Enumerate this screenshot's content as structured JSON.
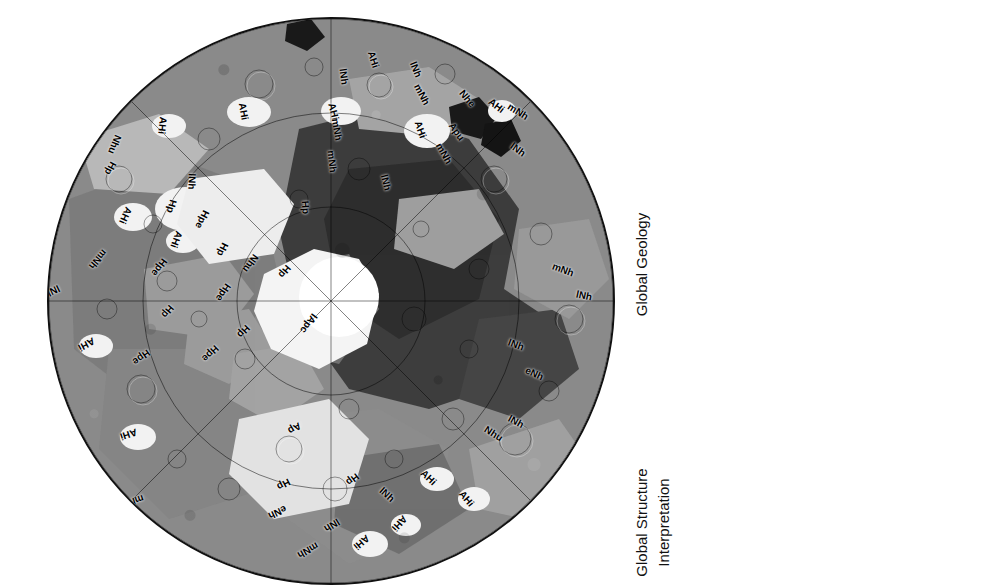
{
  "figure": {
    "kind": "geologic-map",
    "projection": "polar-stereographic"
  },
  "map": {
    "background_color": "#8a8a8a",
    "border_color": "#111111",
    "labels": [
      {
        "text": "AHi",
        "x": 377,
        "y": 58,
        "rot": -18
      },
      {
        "text": "lNh",
        "x": 348,
        "y": 75,
        "rot": -8
      },
      {
        "text": "lNh",
        "x": 420,
        "y": 68,
        "rot": -22
      },
      {
        "text": "mNh",
        "x": 423,
        "y": 93,
        "rot": -28
      },
      {
        "text": "Nhe",
        "x": 470,
        "y": 97,
        "rot": -40
      },
      {
        "text": "AHi",
        "x": 500,
        "y": 104,
        "rot": -52
      },
      {
        "text": "mNh",
        "x": 519,
        "y": 110,
        "rot": -58
      },
      {
        "text": "AHi",
        "x": 247,
        "y": 110,
        "rot": -10
      },
      {
        "text": "AHi",
        "x": 337,
        "y": 110,
        "rot": -14
      },
      {
        "text": "mNh",
        "x": 338,
        "y": 128,
        "rot": -10
      },
      {
        "text": "AHi",
        "x": 424,
        "y": 128,
        "rot": -20
      },
      {
        "text": "Apu",
        "x": 459,
        "y": 130,
        "rot": -36
      },
      {
        "text": "AHi",
        "x": 166,
        "y": 124,
        "rot": 6
      },
      {
        "text": "mNh",
        "x": 333,
        "y": 160,
        "rot": -6
      },
      {
        "text": "mNh",
        "x": 445,
        "y": 152,
        "rot": -30
      },
      {
        "text": "lNh",
        "x": 522,
        "y": 148,
        "rot": -54
      },
      {
        "text": "Nhu",
        "x": 117,
        "y": 143,
        "rot": 22
      },
      {
        "text": "Hp",
        "x": 116,
        "y": 167,
        "rot": 28
      },
      {
        "text": "lNh",
        "x": 196,
        "y": 180,
        "rot": 2
      },
      {
        "text": "lNh",
        "x": 390,
        "y": 181,
        "rot": -14
      },
      {
        "text": "Hp",
        "x": 311,
        "y": 206,
        "rot": -4
      },
      {
        "text": "AHi",
        "x": 129,
        "y": 214,
        "rot": 24
      },
      {
        "text": "Hp",
        "x": 177,
        "y": 205,
        "rot": 16
      },
      {
        "text": "AHi",
        "x": 180,
        "y": 238,
        "rot": 20
      },
      {
        "text": "AHi",
        "x": 55,
        "y": 206,
        "rot": 50
      },
      {
        "text": "mNh",
        "x": 99,
        "y": 258,
        "rot": 40
      },
      {
        "text": "Hpe",
        "x": 205,
        "y": 218,
        "rot": 26
      },
      {
        "text": "Hpe",
        "x": 162,
        "y": 266,
        "rot": 36
      },
      {
        "text": "Hp",
        "x": 228,
        "y": 248,
        "rot": 26
      },
      {
        "text": "Nhu",
        "x": 253,
        "y": 262,
        "rot": 36
      },
      {
        "text": "Hpe",
        "x": 226,
        "y": 291,
        "rot": 34
      },
      {
        "text": "Hp",
        "x": 173,
        "y": 310,
        "rot": 40
      },
      {
        "text": "lNh",
        "x": 56,
        "y": 290,
        "rot": 64
      },
      {
        "text": "mNh",
        "x": 564,
        "y": 268,
        "rot": -70
      },
      {
        "text": "lNh",
        "x": 588,
        "y": 294,
        "rot": -78
      },
      {
        "text": "lApc",
        "x": 310,
        "y": 322,
        "rot": 36
      },
      {
        "text": "Hpe",
        "x": 213,
        "y": 352,
        "rot": 46
      },
      {
        "text": "AHi",
        "x": 90,
        "y": 343,
        "rot": 62
      },
      {
        "text": "Hpe",
        "x": 144,
        "y": 356,
        "rot": 54
      },
      {
        "text": "Hp",
        "x": 249,
        "y": 330,
        "rot": 44
      },
      {
        "text": "lNh",
        "x": 520,
        "y": 343,
        "rot": -70
      },
      {
        "text": "eNh",
        "x": 537,
        "y": 372,
        "rot": -66
      },
      {
        "text": "AHi",
        "x": 132,
        "y": 433,
        "rot": 72
      },
      {
        "text": "Ap",
        "x": 300,
        "y": 427,
        "rot": 58
      },
      {
        "text": "lNh",
        "x": 520,
        "y": 420,
        "rot": -62
      },
      {
        "text": "Nhu",
        "x": 496,
        "y": 432,
        "rot": -58
      },
      {
        "text": "Hp",
        "x": 290,
        "y": 270,
        "rot": 40
      },
      {
        "text": "Hp",
        "x": 358,
        "y": 478,
        "rot": 52
      },
      {
        "text": "Hp",
        "x": 289,
        "y": 483,
        "rot": 62
      },
      {
        "text": "eNh",
        "x": 280,
        "y": 511,
        "rot": 64
      },
      {
        "text": "lNh",
        "x": 391,
        "y": 493,
        "rot": -48
      },
      {
        "text": "AHi",
        "x": 432,
        "y": 476,
        "rot": -46
      },
      {
        "text": "lNh",
        "x": 336,
        "y": 524,
        "rot": 58
      },
      {
        "text": "mNh",
        "x": 309,
        "y": 549,
        "rot": 60
      },
      {
        "text": "AHi",
        "x": 365,
        "y": 541,
        "rot": 50
      },
      {
        "text": "AHi",
        "x": 403,
        "y": 522,
        "rot": 42
      },
      {
        "text": "AHi",
        "x": 470,
        "y": 497,
        "rot": -40
      },
      {
        "text": "mNh",
        "x": 134,
        "y": 500,
        "rot": 72
      }
    ]
  },
  "legend": {
    "structure": {
      "header": "Global  Structure",
      "subheader": "Interpretation",
      "items": [
        {
          "label": "Caldera rim",
          "symbol": "thin-line"
        },
        {
          "label": "Channel axis",
          "symbol": "thin-line"
        },
        {
          "label": "Crater rim",
          "symbol": "hairline"
        },
        {
          "label": "Graben axis",
          "symbol": "line-dot"
        },
        {
          "label": "Lobate flow",
          "symbol": "line-solid-triangle"
        },
        {
          "label": "Outflow channel",
          "symbol": "line-arrow"
        },
        {
          "label": "Pit crater chain",
          "symbol": "line-open-circle"
        },
        {
          "label": "Ridge",
          "symbol": "line-open-diamond"
        },
        {
          "label": "Rille",
          "symbol": "line-small-dot"
        },
        {
          "label": "Scarp",
          "symbol": "line-half-triangle"
        },
        {
          "label": "Spiral trough",
          "symbol": "line-gray-dot"
        },
        {
          "label": "Wrinkle ridge",
          "symbol": "line-solid-diamond"
        },
        {
          "label": "Yardangs",
          "symbol": "double-arrow"
        }
      ]
    },
    "geology": {
      "header": "Global  Geology",
      "groups": [
        {
          "title": "Polar units",
          "units": [
            {
              "code": "Ap",
              "color": "#d9d9d9"
            },
            {
              "code": "lApc",
              "color": "#ffffff"
            },
            {
              "code": "Hpe",
              "color": "#a8a8a8"
            },
            {
              "code": "Hp",
              "color": "#6e6e6e"
            },
            {
              "code": "Apu",
              "color": "#1c1c1c"
            }
          ]
        },
        {
          "title": "Volcanic unit",
          "units": [
            {
              "code": "lNv",
              "color": "#101010"
            }
          ]
        },
        {
          "title": "Highland units",
          "units": [
            {
              "code": "mNh",
              "color": "#6a6a6a"
            },
            {
              "code": "lNh",
              "color": "#c2c2c2"
            },
            {
              "code": "eNh",
              "color": "#3a3a3a"
            },
            {
              "code": "Nhe",
              "color": "#0d0d0d"
            },
            {
              "code": "Nhu",
              "color": "#555555"
            }
          ]
        },
        {
          "title": "Impact unit",
          "units": [
            {
              "code": "AHi",
              "color": "#ffffff"
            }
          ]
        }
      ]
    }
  }
}
